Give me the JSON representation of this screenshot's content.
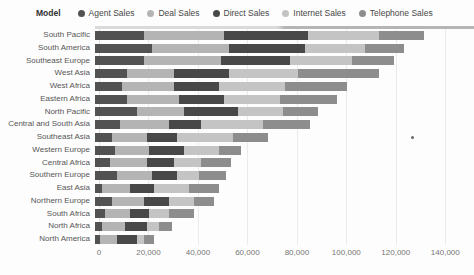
{
  "legend": {
    "title": "Model",
    "items": [
      {
        "label": "Agent Sales",
        "color": "#525252"
      },
      {
        "label": "Deal Sales",
        "color": "#b4b4b4"
      },
      {
        "label": "Direct Sales",
        "color": "#484848"
      },
      {
        "label": "Internet Sales",
        "color": "#c4c4c4"
      },
      {
        "label": "Telephone Sales",
        "color": "#8d8d8d"
      }
    ]
  },
  "chart_data": {
    "type": "bar",
    "orientation": "horizontal",
    "stacked": true,
    "title": "",
    "legend_title": "Model",
    "legend_position": "top",
    "grid": true,
    "categories": [
      "South Pacific",
      "South America",
      "Southeast Europe",
      "West Asia",
      "West Africa",
      "Eastern Africa",
      "North Pacific",
      "Central and South Asia",
      "Southeast Asia",
      "Western Europe",
      "Central Africa",
      "Southern Europe",
      "East Asia",
      "Northern Europe",
      "South Africa",
      "North Africa",
      "North America"
    ],
    "series": [
      {
        "name": "Agent Sales",
        "color": "#525252",
        "values": [
          20000,
          23000,
          20000,
          13000,
          11000,
          13000,
          17000,
          10000,
          7000,
          8000,
          6000,
          9000,
          3000,
          7000,
          4000,
          3000,
          2000
        ]
      },
      {
        "name": "Deal Sales",
        "color": "#b4b4b4",
        "values": [
          32000,
          31000,
          31000,
          19000,
          21000,
          21000,
          19000,
          20000,
          14000,
          14000,
          15000,
          14000,
          11000,
          13000,
          10000,
          9000,
          7000
        ]
      },
      {
        "name": "Direct Sales",
        "color": "#484848",
        "values": [
          34000,
          31000,
          28000,
          22000,
          18000,
          18000,
          22000,
          13000,
          12000,
          14000,
          11000,
          10000,
          10000,
          10000,
          8000,
          9000,
          8000
        ]
      },
      {
        "name": "Internet Sales",
        "color": "#c4c4c4",
        "values": [
          29000,
          24000,
          25000,
          28000,
          27000,
          23000,
          18000,
          25000,
          23000,
          14000,
          11000,
          9000,
          14000,
          10000,
          8000,
          5000,
          3000
        ]
      },
      {
        "name": "Telephone Sales",
        "color": "#8d8d8d",
        "values": [
          18000,
          16000,
          17000,
          33000,
          25000,
          23000,
          14000,
          19000,
          14000,
          9000,
          12000,
          11000,
          12000,
          8000,
          10000,
          5000,
          4000
        ]
      }
    ],
    "totals": [
      133000,
      125000,
      121000,
      115000,
      102000,
      98000,
      90000,
      87000,
      70000,
      59000,
      55000,
      53000,
      50000,
      48000,
      40000,
      31000,
      24000
    ],
    "x_axis": {
      "tick_labels": [
        "0",
        "20,000",
        "40,000",
        "60,000",
        "80,000",
        "100,000",
        "120,000",
        "140,000"
      ],
      "tick_values": [
        0,
        20000,
        40000,
        60000,
        80000,
        100000,
        120000,
        140000
      ],
      "min": 0,
      "max": 150000
    }
  }
}
